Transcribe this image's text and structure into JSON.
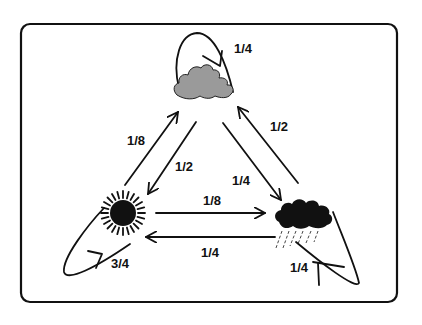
{
  "diagram": {
    "type": "markov-chain",
    "states": [
      {
        "id": "cloudy",
        "icon": "cloud-icon",
        "color": "#9a9a9a"
      },
      {
        "id": "sunny",
        "icon": "sun-icon",
        "color": "#111111"
      },
      {
        "id": "rainy",
        "icon": "rain-cloud-icon",
        "color": "#111111"
      }
    ],
    "transitions": [
      {
        "from": "cloudy",
        "to": "cloudy",
        "label": "1/4"
      },
      {
        "from": "sunny",
        "to": "cloudy",
        "label": "1/8"
      },
      {
        "from": "cloudy",
        "to": "sunny",
        "label": "1/2"
      },
      {
        "from": "rainy",
        "to": "cloudy",
        "label": "1/2"
      },
      {
        "from": "cloudy",
        "to": "rainy",
        "label": "1/4"
      },
      {
        "from": "sunny",
        "to": "rainy",
        "label": "1/8"
      },
      {
        "from": "rainy",
        "to": "sunny",
        "label": "1/4"
      },
      {
        "from": "sunny",
        "to": "sunny",
        "label": "3/4"
      },
      {
        "from": "rainy",
        "to": "rainy",
        "label": "1/4"
      }
    ],
    "frame_color": "#111111",
    "background": "#ffffff"
  }
}
